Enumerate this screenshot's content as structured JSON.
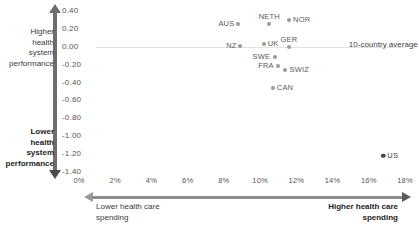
{
  "chart_data": {
    "type": "scatter",
    "title": "",
    "xlabel": "Health care spending as percent of GDP",
    "ylabel": "Health system performance",
    "xlim": [
      0,
      18
    ],
    "ylim": [
      -1.4,
      0.4
    ],
    "grid": false,
    "legend": null,
    "xticks": [
      "0%",
      "2%",
      "4%",
      "6%",
      "8%",
      "10%",
      "12%",
      "14%",
      "16%",
      "18%"
    ],
    "xtick_values": [
      0,
      2,
      4,
      6,
      8,
      10,
      12,
      14,
      16,
      18
    ],
    "yticks": [
      "0.40",
      "0.20",
      "0.00",
      "-0.20",
      "-0.40",
      "-0.60",
      "-0.80",
      "-1.00",
      "-1.20",
      "-1.40"
    ],
    "ytick_values": [
      0.4,
      0.2,
      0.0,
      -0.2,
      -0.4,
      -0.6,
      -0.8,
      -1.0,
      -1.2,
      -1.4
    ],
    "annotations": [
      {
        "text": "10-country average",
        "x": 14.9,
        "y": 0.02
      }
    ],
    "reference_line": {
      "label": "10-country average",
      "y": 0.0,
      "orientation": "horizontal"
    },
    "axis_captions": {
      "y_top": "Higher health system performance",
      "y_top_lines": [
        "Higher",
        "health",
        "system",
        "performance"
      ],
      "y_bottom": "Lower health system performance",
      "y_bottom_lines": [
        "Lower",
        "health",
        "system",
        "performance"
      ],
      "x_left": "Lower health care spending",
      "x_left_lines": [
        "Lower health care",
        "spending"
      ],
      "x_right": "Higher health care spending",
      "x_right_lines": [
        "Higher health care",
        "spending"
      ]
    },
    "points": [
      {
        "label": "AUS",
        "x": 8.8,
        "y": 0.26,
        "label_pos": "left"
      },
      {
        "label": "NETH",
        "x": 10.5,
        "y": 0.26,
        "label_pos": "top"
      },
      {
        "label": "NOR",
        "x": 11.6,
        "y": 0.3,
        "label_pos": "right"
      },
      {
        "label": "NZ",
        "x": 8.9,
        "y": 0.01,
        "label_pos": "left"
      },
      {
        "label": "UK",
        "x": 10.2,
        "y": 0.03,
        "label_pos": "right"
      },
      {
        "label": "GER",
        "x": 11.6,
        "y": 0.0,
        "label_pos": "top"
      },
      {
        "label": "SWE",
        "x": 10.8,
        "y": -0.11,
        "label_pos": "left"
      },
      {
        "label": "FRA",
        "x": 11.0,
        "y": -0.22,
        "label_pos": "left"
      },
      {
        "label": "SWIZ",
        "x": 11.4,
        "y": -0.26,
        "label_pos": "right"
      },
      {
        "label": "CAN",
        "x": 10.7,
        "y": -0.46,
        "label_pos": "right"
      },
      {
        "label": "US",
        "x": 16.8,
        "y": -1.22,
        "label_pos": "right",
        "highlight": true
      }
    ]
  }
}
